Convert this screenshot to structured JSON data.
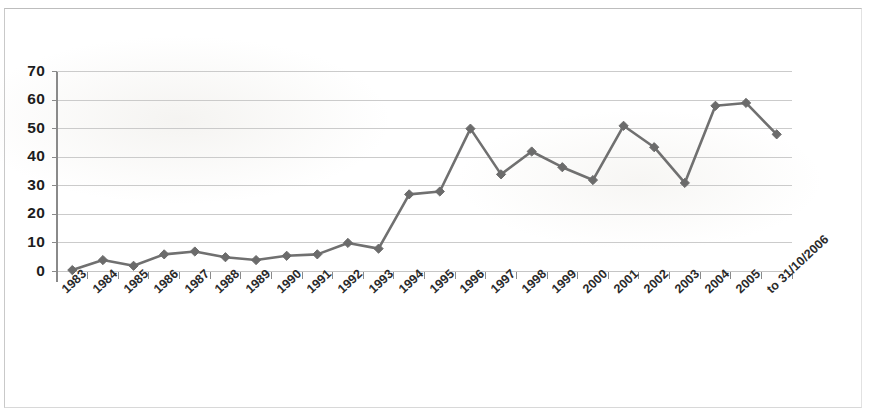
{
  "chart_data": {
    "type": "line",
    "title": "",
    "subtitle": "",
    "xlabel": "",
    "ylabel": "",
    "categories": [
      "1983",
      "1984",
      "1985",
      "1986",
      "1987",
      "1988",
      "1989",
      "1990",
      "1991",
      "1992",
      "1993",
      "1994",
      "1995",
      "1996",
      "1997",
      "1998",
      "1999",
      "2000",
      "2001",
      "2002",
      "2003",
      "2004",
      "2005",
      "to 31/10/2006"
    ],
    "values": [
      0.5,
      4,
      2,
      6,
      7,
      5,
      4,
      5.5,
      6,
      10,
      8,
      27,
      28,
      50,
      34,
      42,
      36.5,
      32,
      51,
      43.5,
      31,
      58,
      59,
      48
    ],
    "series": [
      {
        "name": "",
        "values": [
          0.5,
          4,
          2,
          6,
          7,
          5,
          4,
          5.5,
          6,
          10,
          8,
          27,
          28,
          50,
          34,
          42,
          36.5,
          32,
          51,
          43.5,
          31,
          58,
          59,
          48
        ]
      }
    ],
    "ylim": [
      0,
      70
    ],
    "yticks": [
      0,
      10,
      20,
      30,
      40,
      50,
      60,
      70
    ],
    "ytick_labels": [
      "0",
      "10",
      "20",
      "30",
      "40",
      "50",
      "60",
      "70"
    ],
    "grid": true,
    "grid_axis": "y",
    "legend": false,
    "legend_position": "none",
    "marker": "diamond",
    "colors": {
      "line": "#707070",
      "marker": "#6b6b6b",
      "grid": "#c5c5c5",
      "axis": "#8a8a8a",
      "text": "#1d1d1d"
    }
  }
}
